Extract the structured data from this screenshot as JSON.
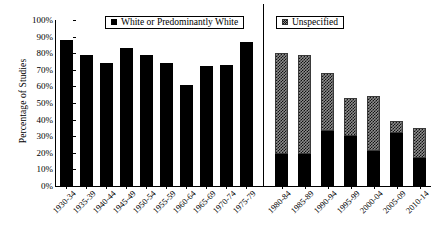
{
  "chart_data": {
    "type": "bar",
    "title": "",
    "xlabel": "",
    "ylabel": "Percentage of Studies",
    "ylim": [
      0,
      100
    ],
    "yticks": [
      "0%",
      "10%",
      "20%",
      "30%",
      "40%",
      "50%",
      "60%",
      "70%",
      "80%",
      "90%",
      "100%"
    ],
    "grid": false,
    "legend_position": "top",
    "legend": [
      {
        "label": "White or Predominantly White",
        "swatch": "solid-black",
        "color": "#000000"
      },
      {
        "label": "Unspecified",
        "swatch": "dotted-gray",
        "color": "#8e8e8e"
      }
    ],
    "categories": [
      "1930-34",
      "1935-39",
      "1940-44",
      "1945-49",
      "1950-54",
      "1955-59",
      "1960-64",
      "1965-69",
      "1970-74",
      "1975-79",
      "1980-84",
      "1985-89",
      "1990-94",
      "1995-99",
      "2000-04",
      "2005-09",
      "2010-14"
    ],
    "series": [
      {
        "name": "White or Predominantly White",
        "values": [
          88,
          79,
          74,
          83,
          79,
          74,
          61,
          72,
          73,
          87,
          19,
          19,
          33,
          30,
          21,
          32,
          17
        ]
      },
      {
        "name": "Unspecified",
        "values": [
          0,
          0,
          0,
          0,
          0,
          0,
          0,
          0,
          0,
          0,
          61,
          60,
          35,
          23,
          33,
          7,
          18
        ]
      }
    ],
    "panels": [
      {
        "name": "left-panel",
        "legend": "White or Predominantly White",
        "categories": [
          "1930-34",
          "1935-39",
          "1940-44",
          "1945-49",
          "1950-54",
          "1955-59",
          "1960-64",
          "1965-69",
          "1970-74",
          "1975-79"
        ],
        "bars": [
          {
            "category": "1930-34",
            "black": 88,
            "dotted": 0
          },
          {
            "category": "1935-39",
            "black": 79,
            "dotted": 0
          },
          {
            "category": "1940-44",
            "black": 74,
            "dotted": 0
          },
          {
            "category": "1945-49",
            "black": 83,
            "dotted": 0
          },
          {
            "category": "1950-54",
            "black": 79,
            "dotted": 0
          },
          {
            "category": "1955-59",
            "black": 74,
            "dotted": 0
          },
          {
            "category": "1960-64",
            "black": 61,
            "dotted": 0
          },
          {
            "category": "1965-69",
            "black": 72,
            "dotted": 0
          },
          {
            "category": "1970-74",
            "black": 73,
            "dotted": 0
          },
          {
            "category": "1975-79",
            "black": 87,
            "dotted": 0
          }
        ]
      },
      {
        "name": "right-panel",
        "legend": "Unspecified",
        "categories": [
          "1980-84",
          "1985-89",
          "1990-94",
          "1995-99",
          "2000-04",
          "2005-09",
          "2010-14"
        ],
        "bars": [
          {
            "category": "1980-84",
            "black": 19,
            "dotted": 61,
            "total": 80
          },
          {
            "category": "1985-89",
            "black": 19,
            "dotted": 60,
            "total": 79
          },
          {
            "category": "1990-94",
            "black": 33,
            "dotted": 35,
            "total": 68
          },
          {
            "category": "1995-99",
            "black": 30,
            "dotted": 23,
            "total": 53
          },
          {
            "category": "2000-04",
            "black": 21,
            "dotted": 33,
            "total": 54
          },
          {
            "category": "2005-09",
            "black": 32,
            "dotted": 7,
            "total": 39
          },
          {
            "category": "2010-14",
            "black": 17,
            "dotted": 18,
            "total": 35
          }
        ]
      }
    ]
  }
}
